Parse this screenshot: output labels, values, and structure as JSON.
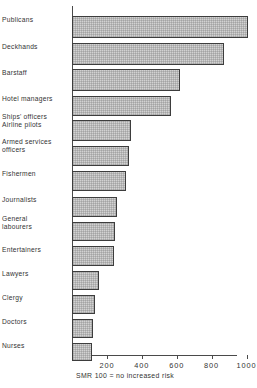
{
  "chart_data": {
    "type": "bar",
    "orientation": "horizontal",
    "title": "",
    "xlabel": "",
    "ylabel": "",
    "caption": "SMR 100 = no increased risk",
    "xlim": [
      0,
      1060
    ],
    "xticks": [
      200,
      400,
      600,
      800,
      1000
    ],
    "xtick_labels": [
      "200",
      "400",
      "600",
      "800",
      "1000"
    ],
    "grid": false,
    "legend": null,
    "categories": [
      "Publicans",
      "Deckhands",
      "Barstaff",
      "Hotel managers",
      "Ships' officers\nAirline pilots",
      "Armed services\nofficers",
      "Fishermen",
      "Journalists",
      "General\nlabourers",
      "Entertainers",
      "Lawyers",
      "Clergy",
      "Doctors",
      "Nurses"
    ],
    "values": [
      1010,
      870,
      620,
      570,
      340,
      325,
      310,
      260,
      245,
      240,
      155,
      130,
      120,
      113
    ],
    "bars": [
      {
        "label": "Publicans",
        "value": 1010,
        "y": 10,
        "h": 22
      },
      {
        "label": "Deckhands",
        "value": 870,
        "y": 37,
        "h": 22
      },
      {
        "label": "Barstaff",
        "value": 620,
        "y": 63,
        "h": 22
      },
      {
        "label": "Hotel managers",
        "value": 570,
        "y": 90,
        "h": 20
      },
      {
        "label": "Ships' officers / Airline pilots",
        "value": 340,
        "y": 114,
        "h": 21
      },
      {
        "label": "Armed services officers",
        "value": 325,
        "y": 140,
        "h": 20
      },
      {
        "label": "Fishermen",
        "value": 310,
        "y": 165,
        "h": 20
      },
      {
        "label": "Journalists",
        "value": 260,
        "y": 191,
        "h": 20
      },
      {
        "label": "General labourers",
        "value": 245,
        "y": 216,
        "h": 19
      },
      {
        "label": "Entertainers",
        "value": 240,
        "y": 240,
        "h": 20
      },
      {
        "label": "Lawyers",
        "value": 155,
        "y": 265,
        "h": 19
      },
      {
        "label": "Clergy",
        "value": 130,
        "y": 289,
        "h": 19
      },
      {
        "label": "Doctors",
        "value": 120,
        "y": 313,
        "h": 19
      },
      {
        "label": "Nurses",
        "value": 113,
        "y": 337,
        "h": 18
      }
    ]
  },
  "axis": {
    "tick_200": "200",
    "tick_400": "400",
    "tick_600": "600",
    "tick_800": "800",
    "tick_1000": "1000"
  },
  "labels": {
    "l0": "Publicans",
    "l1": "Deckhands",
    "l2": "Barstaff",
    "l3": "Hotel managers",
    "l4": "Ships' officers\nAirline pilots",
    "l5": "Armed services\nofficers",
    "l6": "Fishermen",
    "l7": "Journalists",
    "l8": "General\nlabourers",
    "l9": "Entertainers",
    "l10": "Lawyers",
    "l11": "Clergy",
    "l12": "Doctors",
    "l13": "Nurses"
  },
  "caption": "SMR 100 = no increased risk",
  "colors": {
    "bar_fill": "#d2d2d2",
    "bar_stroke": "#3d3d3d",
    "axis": "#4a4a4a",
    "text": "#333333",
    "background": "#ffffff"
  }
}
